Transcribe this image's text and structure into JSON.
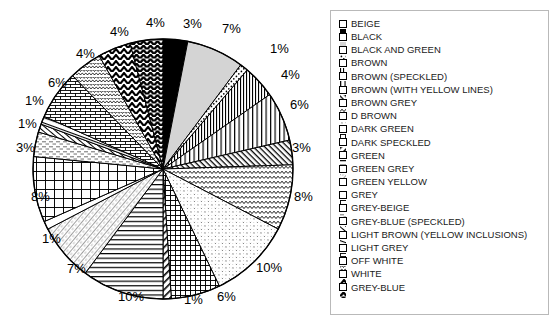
{
  "chart_data": {
    "type": "pie",
    "title": "",
    "xlabel": "",
    "ylabel": "",
    "legend_position": "right",
    "grid": false,
    "start_angle_deg": 0,
    "direction": "clockwise",
    "label_format": "percent",
    "categories": [
      "BEIGE",
      "BLACK",
      "BLACK AND GREEN",
      "BROWN",
      "BROWN (SPECKLED)",
      "BROWN (WITH YELLOW LINES)",
      "BROWN GREY",
      "D BROWN",
      "DARK GREEN",
      "DARK SPECKLED",
      "GREEN",
      "GREEN GREY",
      "GREEN YELLOW",
      "GREY",
      "GREY-BEIGE",
      "GREY-BLUE (SPECKLED)",
      "LIGHT BROWN (YELLOW INCLUSIONS)",
      "LIGHT GREY",
      "OFF WHITE",
      "WHITE",
      "GREY-BLUE"
    ],
    "values": [
      3,
      7,
      1,
      4,
      6,
      3,
      8,
      10,
      6,
      1,
      10,
      7,
      1,
      8,
      3,
      1,
      1,
      6,
      4,
      4,
      4
    ],
    "labels": [
      "3%",
      "7%",
      "1%",
      "4%",
      "6%",
      "3%",
      "8%",
      "10%",
      "6%",
      "1%",
      "10%",
      "7%",
      "1%",
      "8%",
      "3%",
      "1%",
      "1%",
      "6%",
      "4%",
      "4%",
      "4%"
    ],
    "slice_patterns": [
      "solid-black",
      "light-grey-solid",
      "sparse-dots",
      "narrow-vertical-lines",
      "vertical-lines",
      "fine-diagonal-hatch",
      "wavy-zigzag",
      "light-speckle",
      "crosshatch-grid",
      "diagonal-stripes",
      "horizontal-lines",
      "diagonal-hatch-light",
      "white-plain",
      "large-grid",
      "dashed-horizontal",
      "thin-diagonal",
      "thin-diagonal-2",
      "brick",
      "stipple-scale",
      "chevron-up",
      "chevron-dense"
    ]
  },
  "legend": {
    "items": [
      {
        "label": "BEIGE",
        "swatch": "solid-black"
      },
      {
        "label": "BLACK",
        "swatch": "light-grey-solid"
      },
      {
        "label": "BLACK AND GREEN",
        "swatch": "sparse-dots"
      },
      {
        "label": "BROWN",
        "swatch": "narrow-vertical-lines"
      },
      {
        "label": "BROWN (SPECKLED)",
        "swatch": "vertical-lines"
      },
      {
        "label": "BROWN (WITH YELLOW LINES)",
        "swatch": "fine-diagonal-hatch"
      },
      {
        "label": "BROWN GREY",
        "swatch": "wavy-zigzag"
      },
      {
        "label": "D BROWN",
        "swatch": "light-speckle"
      },
      {
        "label": "DARK GREEN",
        "swatch": "crosshatch-grid"
      },
      {
        "label": "DARK SPECKLED",
        "swatch": "diagonal-stripes"
      },
      {
        "label": "GREEN",
        "swatch": "horizontal-lines"
      },
      {
        "label": "GREEN GREY",
        "swatch": "diagonal-hatch-light"
      },
      {
        "label": "GREEN YELLOW",
        "swatch": "white-plain"
      },
      {
        "label": "GREY",
        "swatch": "large-grid"
      },
      {
        "label": "GREY-BEIGE",
        "swatch": "dashed-horizontal"
      },
      {
        "label": "GREY-BLUE (SPECKLED)",
        "swatch": "thin-diagonal"
      },
      {
        "label": "LIGHT BROWN (YELLOW INCLUSIONS)",
        "swatch": "thin-diagonal-2"
      },
      {
        "label": "LIGHT GREY",
        "swatch": "brick"
      },
      {
        "label": "OFF WHITE",
        "swatch": "stipple-scale"
      },
      {
        "label": "WHITE",
        "swatch": "chevron-up"
      },
      {
        "label": "GREY-BLUE",
        "swatch": "chevron-dense"
      }
    ]
  },
  "pie_labels": [
    {
      "text": "3%",
      "x": 183,
      "y": 17
    },
    {
      "text": "7%",
      "x": 222,
      "y": 22
    },
    {
      "text": "1%",
      "x": 270,
      "y": 42
    },
    {
      "text": "4%",
      "x": 281,
      "y": 68
    },
    {
      "text": "6%",
      "x": 290,
      "y": 98
    },
    {
      "text": "3%",
      "x": 292,
      "y": 141
    },
    {
      "text": "8%",
      "x": 294,
      "y": 190
    },
    {
      "text": "10%",
      "x": 256,
      "y": 261
    },
    {
      "text": "6%",
      "x": 217,
      "y": 290
    },
    {
      "text": "1%",
      "x": 184,
      "y": 293
    },
    {
      "text": "10%",
      "x": 118,
      "y": 290
    },
    {
      "text": "7%",
      "x": 67,
      "y": 262
    },
    {
      "text": "1%",
      "x": 42,
      "y": 232
    },
    {
      "text": "8%",
      "x": 31,
      "y": 190
    },
    {
      "text": "3%",
      "x": 16,
      "y": 141
    },
    {
      "text": "1%",
      "x": 18,
      "y": 117
    },
    {
      "text": "1%",
      "x": 25,
      "y": 94
    },
    {
      "text": "6%",
      "x": 48,
      "y": 76
    },
    {
      "text": "4%",
      "x": 76,
      "y": 47
    },
    {
      "text": "4%",
      "x": 110,
      "y": 25
    },
    {
      "text": "4%",
      "x": 146,
      "y": 16
    }
  ],
  "colors": {
    "stroke": "#000000",
    "background": "#ffffff",
    "legend_border": "#b9b9b9",
    "legend_text": "#1a1a1a",
    "label_text": "#000000",
    "black_slice": "#000000",
    "light_grey_slice": "#d4d4d4"
  }
}
